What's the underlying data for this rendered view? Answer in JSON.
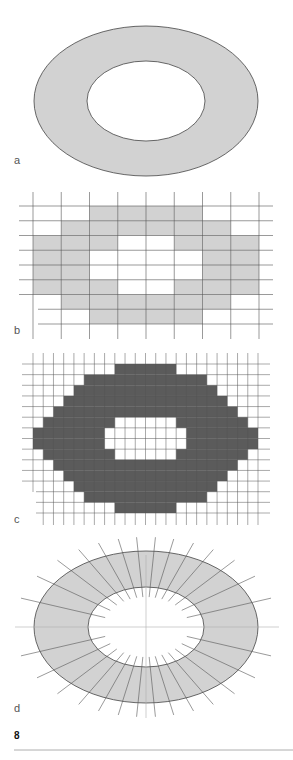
{
  "figure": {
    "number": "8",
    "colors": {
      "light_fill": "#d2d2d2",
      "dark_fill": "#5b5b5b",
      "outline": "#444444",
      "grid_line": "#555555",
      "faint_line": "#b0b0b0",
      "rule": "#999999"
    },
    "panels": [
      {
        "id": "a",
        "label": "a",
        "description": "Continuous annulus (ring) between two concentric ellipses"
      },
      {
        "id": "b",
        "label": "b",
        "description": "Coarse raster approximation of the ring",
        "grid": {
          "cols": 8,
          "rows": 8
        },
        "filled_cells": [
          [
            2,
            3,
            4,
            5
          ],
          [
            1,
            2,
            3,
            4,
            5,
            6
          ],
          [
            0,
            1,
            2,
            5,
            6,
            7
          ],
          [
            0,
            1,
            6,
            7
          ],
          [
            0,
            1,
            6,
            7
          ],
          [
            0,
            1,
            2,
            5,
            6,
            7
          ],
          [
            1,
            2,
            3,
            4,
            5,
            6
          ],
          [
            2,
            3,
            4,
            5
          ]
        ]
      },
      {
        "id": "c",
        "label": "c",
        "description": "Fine raster approximation of the ring",
        "grid": {
          "cols": 22,
          "rows": 14
        },
        "filled_spans": [
          [
            [
              8,
              13
            ]
          ],
          [
            [
              5,
              16
            ]
          ],
          [
            [
              4,
              17
            ]
          ],
          [
            [
              3,
              18
            ]
          ],
          [
            [
              2,
              19
            ]
          ],
          [
            [
              1,
              7
            ],
            [
              14,
              20
            ]
          ],
          [
            [
              0,
              6
            ],
            [
              15,
              21
            ]
          ],
          [
            [
              0,
              6
            ],
            [
              15,
              21
            ]
          ],
          [
            [
              1,
              7
            ],
            [
              14,
              20
            ]
          ],
          [
            [
              2,
              19
            ]
          ],
          [
            [
              3,
              18
            ]
          ],
          [
            [
              4,
              17
            ]
          ],
          [
            [
              5,
              16
            ]
          ],
          [
            [
              8,
              13
            ]
          ]
        ]
      },
      {
        "id": "d",
        "label": "d",
        "description": "Ring divided into radial sectors with centre axes",
        "radial_line_count": 28
      }
    ]
  }
}
